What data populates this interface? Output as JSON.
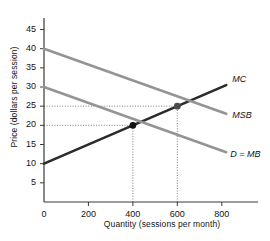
{
  "chart_data": {
    "type": "line",
    "title": "",
    "xlabel": "Quantity (sessions per month)",
    "ylabel": "Price (dollars per session)",
    "xlim": [
      0,
      900
    ],
    "ylim": [
      0,
      48
    ],
    "grid": false,
    "legend": "inline-right",
    "xticks": [
      "0",
      "200",
      "400",
      "600",
      "800"
    ],
    "xtick_values": [
      0,
      200,
      400,
      600,
      800
    ],
    "yticks": [
      "5",
      "10",
      "15",
      "20",
      "25",
      "30",
      "35",
      "40",
      "45"
    ],
    "ytick_values": [
      5,
      10,
      15,
      20,
      25,
      30,
      35,
      40,
      45
    ],
    "series": [
      {
        "name": "MC",
        "label": "MC",
        "color": "#2b2b2b",
        "points": [
          [
            0,
            10
          ],
          [
            820,
            30.5
          ]
        ]
      },
      {
        "name": "MSB",
        "label": "MSB",
        "color": "#949494",
        "points": [
          [
            0,
            40
          ],
          [
            820,
            23
          ]
        ]
      },
      {
        "name": "D = MB",
        "label": "D = MB",
        "color": "#949494",
        "points": [
          [
            0,
            30
          ],
          [
            820,
            13
          ]
        ]
      }
    ],
    "markers": [
      {
        "name": "private-equilibrium",
        "x": 400,
        "y": 20,
        "color": "#111111"
      },
      {
        "name": "efficient-quantity",
        "x": 600,
        "y": 25,
        "color": "#4a4a4a"
      }
    ],
    "guide_lines": [
      {
        "name": "hline-20",
        "orientation": "horizontal",
        "value": 20,
        "from": 0,
        "to": 400
      },
      {
        "name": "hline-25",
        "orientation": "horizontal",
        "value": 25,
        "from": 0,
        "to": 600
      },
      {
        "name": "vline-400",
        "orientation": "vertical",
        "value": 400,
        "from": 0,
        "to": 20
      },
      {
        "name": "vline-600",
        "orientation": "vertical",
        "value": 600,
        "from": 0,
        "to": 25
      }
    ],
    "annotations": []
  },
  "caption": {
    "clipped_text": ""
  }
}
